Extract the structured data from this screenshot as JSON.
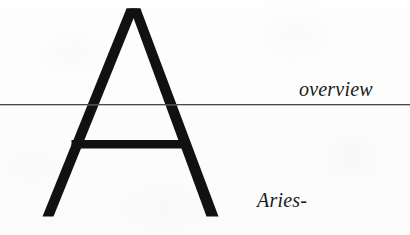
{
  "page": {
    "width": 410,
    "height": 235,
    "background_color": "#fdfdfd",
    "ink_color": "#111111",
    "rule_color": "#4a4a4a",
    "media": "scanned-book-page-fragment"
  },
  "display_letter": {
    "character": "A",
    "style": "monoline-display-capital",
    "color": "#111111",
    "icon_name": "letter-a-display-glyph"
  },
  "rule": {
    "icon_name": "horizontal-rule",
    "y": 105,
    "thickness": 1
  },
  "captions": {
    "overview": "overview",
    "aries": "Aries-"
  }
}
